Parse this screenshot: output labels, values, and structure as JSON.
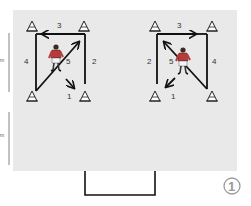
{
  "diagram": {
    "field_color": "#e9e9e9",
    "line_color": "#111111",
    "figure_number": "1",
    "measure_labels": [
      "m",
      "m"
    ],
    "drills": [
      {
        "name": "left-drill",
        "labels": {
          "one": "1",
          "two": "2",
          "three": "3",
          "four": "4",
          "five": "5"
        }
      },
      {
        "name": "right-drill",
        "labels": {
          "one": "1",
          "two": "2",
          "three": "3",
          "four": "4",
          "five": "5"
        }
      }
    ],
    "player": {
      "shirt_color": "#b83a3a",
      "shorts_color": "#f4f4f4"
    }
  }
}
